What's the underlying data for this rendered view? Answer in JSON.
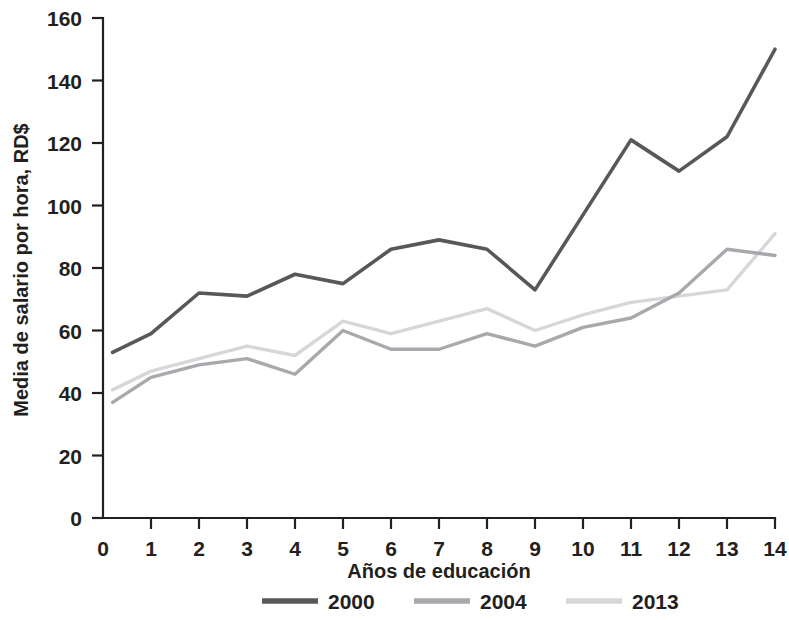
{
  "chart_data": {
    "type": "line",
    "title": "",
    "xlabel": "Años de educación",
    "ylabel": "Media de salario por hora, RD$",
    "x": [
      0.2,
      1,
      2,
      3,
      4,
      5,
      6,
      7,
      8,
      9,
      10,
      11,
      12,
      13,
      14
    ],
    "xticks": [
      "0",
      "1",
      "2",
      "3",
      "4",
      "5",
      "6",
      "7",
      "8",
      "9",
      "10",
      "11",
      "12",
      "13",
      "14"
    ],
    "yticks": [
      "0",
      "20",
      "40",
      "60",
      "80",
      "100",
      "120",
      "140",
      "160"
    ],
    "xlim": [
      0,
      14
    ],
    "ylim": [
      0,
      160
    ],
    "grid": false,
    "legend_position": "bottom",
    "series": [
      {
        "name": "2000",
        "color": "#58585a",
        "width": 3.6,
        "values": [
          53,
          59,
          72,
          71,
          78,
          75,
          86,
          89,
          86,
          73,
          97,
          121,
          111,
          122,
          150
        ]
      },
      {
        "name": "2004",
        "color": "#a7a9ac",
        "width": 3.4,
        "values": [
          37,
          45,
          49,
          51,
          46,
          60,
          54,
          54,
          59,
          55,
          61,
          64,
          72,
          86,
          84
        ]
      },
      {
        "name": "2013",
        "color": "#d6d7d9",
        "width": 3.4,
        "values": [
          41,
          47,
          51,
          55,
          52,
          63,
          59,
          63,
          67,
          60,
          65,
          69,
          71,
          73,
          91
        ]
      }
    ]
  },
  "legend": {
    "items": [
      {
        "label": "2000",
        "color": "#58585a"
      },
      {
        "label": "2004",
        "color": "#a7a9ac"
      },
      {
        "label": "2013",
        "color": "#d6d7d9"
      }
    ]
  }
}
